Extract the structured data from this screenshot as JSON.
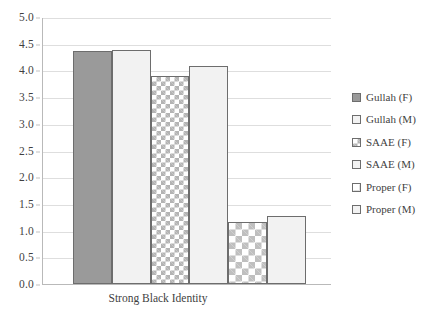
{
  "chart_data": {
    "type": "bar",
    "title": "",
    "subtitle": "",
    "xlabel": "Strong Black Identity",
    "ylabel": "",
    "categories": [
      "Strong Black Identity"
    ],
    "ylim": [
      0.0,
      5.0
    ],
    "y_ticks": [
      "0.0",
      "0.5",
      "1.0",
      "1.5",
      "2.0",
      "2.5",
      "3.0",
      "3.5",
      "4.0",
      "4.5",
      "5.0"
    ],
    "y_tick_values": [
      0.0,
      0.5,
      1.0,
      1.5,
      2.0,
      2.5,
      3.0,
      3.5,
      4.0,
      4.5,
      5.0
    ],
    "grid": true,
    "legend_position": "right",
    "series": [
      {
        "name": "Gullah (F)",
        "values": [
          4.36
        ],
        "fill": "fill-solid-gray",
        "swatch_color": "#9a9a9a"
      },
      {
        "name": "Gullah (M)",
        "values": [
          4.39
        ],
        "fill": "fill-plain-light",
        "swatch_color": "#f2f2f2"
      },
      {
        "name": "SAAE (F)",
        "values": [
          3.89
        ],
        "fill": "fill-checker",
        "swatch_color": "#b4b4b4"
      },
      {
        "name": "SAAE (M)",
        "values": [
          4.09
        ],
        "fill": "fill-plain-light",
        "swatch_color": "#f2f2f2"
      },
      {
        "name": "Proper (F)",
        "values": [
          1.17
        ],
        "fill": "fill-diamond",
        "swatch_color": "#bfbfbf"
      },
      {
        "name": "Proper (M)",
        "values": [
          1.28
        ],
        "fill": "fill-plain-light",
        "swatch_color": "#f2f2f2"
      }
    ]
  },
  "legend": {
    "items": [
      {
        "label": "Gullah (F)"
      },
      {
        "label": "Gullah (M)"
      },
      {
        "label": "SAAE (F)"
      },
      {
        "label": "SAAE (M)"
      },
      {
        "label": "Proper (F)"
      },
      {
        "label": "Proper (M)"
      }
    ]
  },
  "colors": {
    "grid": "#dedede",
    "axis": "#b9b9b9",
    "bar_outline": "#6d6d6d",
    "text": "#3f3f3f"
  }
}
